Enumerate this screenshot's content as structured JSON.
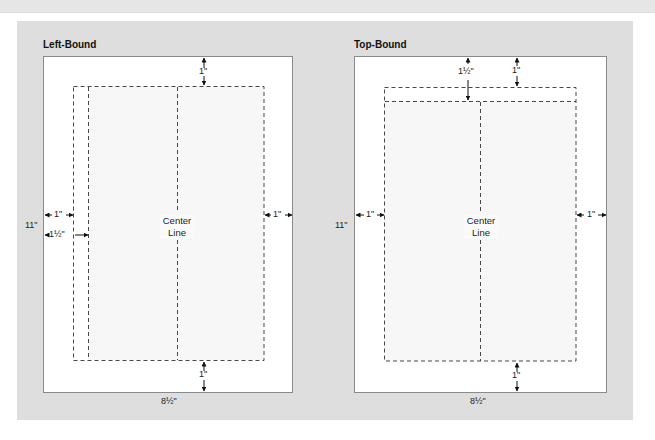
{
  "figure": {
    "panel_color": "#dedede",
    "page_color": "#ffffff",
    "text_area_color": "#f7f7f7",
    "line_color": "#333333"
  },
  "left_bound": {
    "title": "Left-Bound",
    "center_label_line1": "Center",
    "center_label_line2": "Line",
    "top_margin": "1\"",
    "bottom_margin": "1\"",
    "left_margin": "1\"",
    "binding_margin": "1½\"",
    "right_margin": "1\"",
    "height_label": "11\"",
    "width_label": "8½\""
  },
  "top_bound": {
    "title": "Top-Bound",
    "center_label_line1": "Center",
    "center_label_line2": "Line",
    "top_margin": "1\"",
    "binding_margin": "1½\"",
    "bottom_margin": "1\"",
    "left_margin": "1\"",
    "right_margin": "1\"",
    "height_label": "11\"",
    "width_label": "8½\""
  }
}
